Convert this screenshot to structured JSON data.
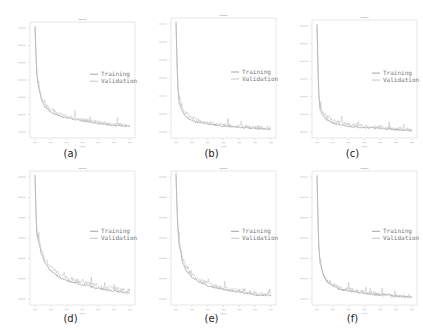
{
  "figure": {
    "captions": [
      "(a)",
      "(b)",
      "(c)",
      "(d)",
      "(e)",
      "(f)"
    ],
    "legend": [
      "Training",
      "Validation"
    ],
    "colors": {
      "training": "#8a8a8a",
      "validation": "#b8b8b8",
      "frame": "#d6d6d6",
      "text": "#222222"
    }
  },
  "chart_data": [
    {
      "type": "line",
      "panel": "(a)",
      "title": "",
      "xlabel": "epoch",
      "ylabel": "",
      "x": [
        0,
        5,
        10,
        20,
        30,
        50,
        75,
        100,
        150,
        200,
        250,
        300
      ],
      "series": [
        {
          "name": "Training",
          "values": [
            1.0,
            0.58,
            0.45,
            0.32,
            0.26,
            0.2,
            0.17,
            0.15,
            0.12,
            0.1,
            0.08,
            0.07
          ]
        },
        {
          "name": "Validation",
          "values": [
            0.98,
            0.6,
            0.47,
            0.34,
            0.28,
            0.23,
            0.19,
            0.16,
            0.13,
            0.11,
            0.09,
            0.08
          ]
        }
      ],
      "xlim": [
        0,
        300
      ],
      "ylim": [
        0,
        1
      ],
      "grid": false,
      "legend_position": "center right"
    },
    {
      "type": "line",
      "panel": "(b)",
      "title": "",
      "xlabel": "epoch",
      "ylabel": "",
      "x": [
        0,
        5,
        10,
        20,
        30,
        50,
        75,
        100,
        150,
        200,
        250,
        300
      ],
      "series": [
        {
          "name": "Training",
          "values": [
            1.0,
            0.45,
            0.28,
            0.2,
            0.16,
            0.12,
            0.1,
            0.09,
            0.07,
            0.06,
            0.05,
            0.04
          ]
        },
        {
          "name": "Validation",
          "values": [
            0.98,
            0.48,
            0.3,
            0.22,
            0.19,
            0.15,
            0.12,
            0.1,
            0.08,
            0.07,
            0.06,
            0.05
          ]
        }
      ],
      "xlim": [
        0,
        300
      ],
      "ylim": [
        0,
        1
      ],
      "grid": false,
      "legend_position": "center right"
    },
    {
      "type": "line",
      "panel": "(c)",
      "title": "",
      "xlabel": "epoch",
      "ylabel": "",
      "x": [
        0,
        5,
        10,
        20,
        30,
        50,
        75,
        100,
        150,
        200,
        250,
        300
      ],
      "series": [
        {
          "name": "Training",
          "values": [
            1.0,
            0.38,
            0.22,
            0.16,
            0.13,
            0.1,
            0.08,
            0.07,
            0.06,
            0.05,
            0.04,
            0.03
          ]
        },
        {
          "name": "Validation",
          "values": [
            0.98,
            0.4,
            0.25,
            0.19,
            0.16,
            0.12,
            0.1,
            0.09,
            0.07,
            0.06,
            0.05,
            0.04
          ]
        }
      ],
      "xlim": [
        0,
        300
      ],
      "ylim": [
        0,
        1
      ],
      "grid": false,
      "legend_position": "center right"
    },
    {
      "type": "line",
      "panel": "(d)",
      "title": "",
      "xlabel": "epoch",
      "ylabel": "",
      "x": [
        0,
        5,
        10,
        20,
        30,
        50,
        75,
        100,
        150,
        200,
        250,
        300
      ],
      "series": [
        {
          "name": "Training",
          "values": [
            1.0,
            0.55,
            0.48,
            0.38,
            0.31,
            0.24,
            0.19,
            0.16,
            0.13,
            0.1,
            0.08,
            0.06
          ]
        },
        {
          "name": "Validation",
          "values": [
            0.98,
            0.57,
            0.5,
            0.41,
            0.34,
            0.27,
            0.22,
            0.18,
            0.15,
            0.12,
            0.1,
            0.08
          ]
        }
      ],
      "xlim": [
        0,
        300
      ],
      "ylim": [
        0,
        1
      ],
      "grid": false,
      "legend_position": "center right"
    },
    {
      "type": "line",
      "panel": "(e)",
      "title": "",
      "xlabel": "epoch",
      "ylabel": "",
      "x": [
        0,
        5,
        10,
        20,
        30,
        50,
        75,
        100,
        150,
        200,
        250,
        300
      ],
      "series": [
        {
          "name": "Training",
          "values": [
            1.0,
            0.6,
            0.45,
            0.32,
            0.25,
            0.19,
            0.15,
            0.12,
            0.09,
            0.07,
            0.05,
            0.04
          ]
        },
        {
          "name": "Validation",
          "values": [
            0.98,
            0.62,
            0.48,
            0.35,
            0.28,
            0.21,
            0.17,
            0.14,
            0.1,
            0.08,
            0.06,
            0.05
          ]
        }
      ],
      "xlim": [
        0,
        300
      ],
      "ylim": [
        0,
        1
      ],
      "grid": false,
      "legend_position": "center right"
    },
    {
      "type": "line",
      "panel": "(f)",
      "title": "",
      "xlabel": "epoch",
      "ylabel": "",
      "x": [
        0,
        5,
        10,
        20,
        30,
        50,
        75,
        100,
        150,
        200,
        250,
        300
      ],
      "series": [
        {
          "name": "Training",
          "values": [
            1.0,
            0.45,
            0.3,
            0.2,
            0.16,
            0.12,
            0.09,
            0.08,
            0.06,
            0.05,
            0.04,
            0.03
          ]
        },
        {
          "name": "Validation",
          "values": [
            0.99,
            0.46,
            0.31,
            0.21,
            0.17,
            0.13,
            0.1,
            0.09,
            0.07,
            0.05,
            0.04,
            0.03
          ]
        }
      ],
      "xlim": [
        0,
        300
      ],
      "ylim": [
        0,
        1
      ],
      "grid": false,
      "legend_position": "center right"
    }
  ]
}
